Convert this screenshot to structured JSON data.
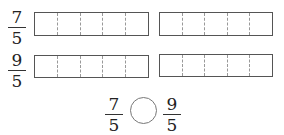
{
  "rows": [
    {
      "fraction": {
        "numerator": "7",
        "denominator": "5"
      },
      "bars": [
        {
          "segments": 5
        },
        {
          "segments": 5
        }
      ]
    },
    {
      "fraction": {
        "numerator": "9",
        "denominator": "5"
      },
      "bars": [
        {
          "segments": 5
        },
        {
          "segments": 5
        }
      ]
    }
  ],
  "comparison": {
    "left": {
      "numerator": "7",
      "denominator": "5"
    },
    "right": {
      "numerator": "9",
      "denominator": "5"
    },
    "answer": ""
  }
}
